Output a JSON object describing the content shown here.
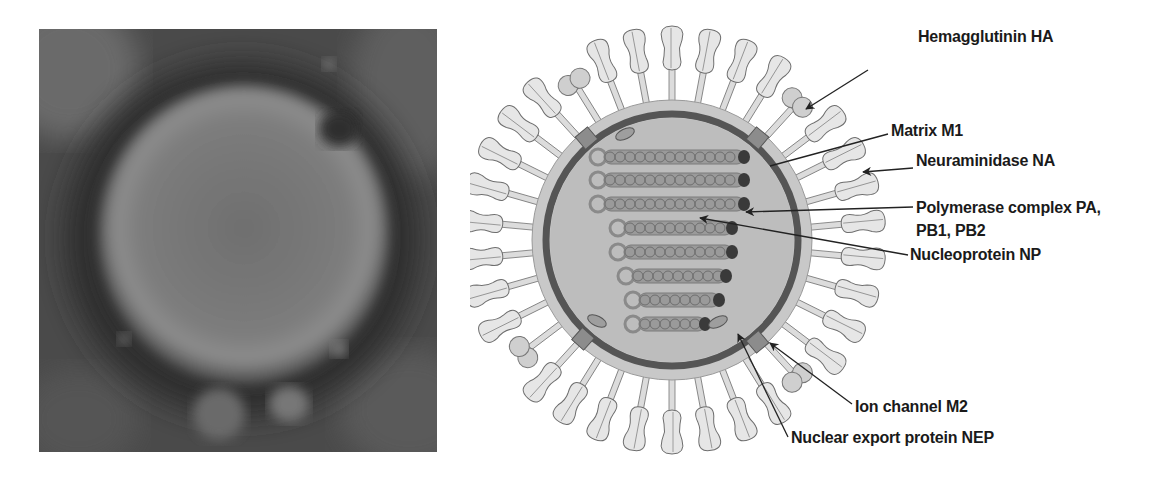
{
  "figure": {
    "left_panel": {
      "type": "electron-micrograph",
      "subject": "influenza virion"
    },
    "right_panel": {
      "type": "schematic",
      "subject": "influenza virus structure",
      "labels": [
        {
          "id": "ha",
          "text": "Hemagglutinin HA"
        },
        {
          "id": "m1",
          "text": "Matrix M1"
        },
        {
          "id": "na",
          "text": "Neuraminidase NA"
        },
        {
          "id": "pol_line1",
          "text": "Polymerase complex PA,"
        },
        {
          "id": "pol_line2",
          "text": "PB1, PB2"
        },
        {
          "id": "np",
          "text": "Nucleoprotein NP"
        },
        {
          "id": "m2",
          "text": "Ion channel M2"
        },
        {
          "id": "nep",
          "text": "Nuclear export protein NEP"
        }
      ]
    },
    "colors": {
      "background": "#ffffff",
      "label_text": "#1a1a1a",
      "envelope": "#c8c8c8",
      "membrane": "#555555",
      "interior": "#bdbdbd",
      "spike_fill": "#e6e6e6",
      "spike_stroke": "#6e6e6e",
      "rnp": "#8a8a8a",
      "polymerase": "#3a3a3a"
    }
  }
}
